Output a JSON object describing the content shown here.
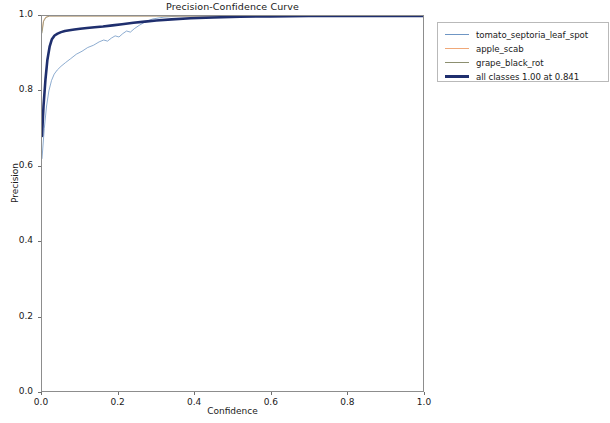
{
  "chart_data": {
    "type": "line",
    "title": "Precision-Confidence Curve",
    "xlabel": "Confidence",
    "ylabel": "Precision",
    "xlim": [
      0.0,
      1.0
    ],
    "ylim": [
      0.0,
      1.0
    ],
    "grid": false,
    "legend_position": "outside right top",
    "xticks": [
      "0.0",
      "0.2",
      "0.4",
      "0.6",
      "0.8",
      "1.0"
    ],
    "yticks": [
      "0.0",
      "0.2",
      "0.4",
      "0.6",
      "0.8",
      "1.0"
    ],
    "xtick_values": [
      0.0,
      0.2,
      0.4,
      0.6,
      0.8,
      1.0
    ],
    "ytick_values": [
      0.0,
      0.2,
      0.4,
      0.6,
      0.8,
      1.0
    ],
    "series": [
      {
        "name": "tomato_septoria_leaf_spot",
        "color": "#6f96c4",
        "width": 0.8,
        "x": [
          0.0,
          0.006,
          0.012,
          0.018,
          0.025,
          0.032,
          0.04,
          0.05,
          0.062,
          0.075,
          0.09,
          0.105,
          0.12,
          0.135,
          0.15,
          0.162,
          0.172,
          0.182,
          0.192,
          0.202,
          0.212,
          0.222,
          0.232,
          0.242,
          0.255,
          0.27,
          0.29,
          0.32,
          0.36,
          0.42,
          0.5,
          0.6,
          0.7,
          0.8,
          0.9,
          1.0
        ],
        "y": [
          0.62,
          0.7,
          0.76,
          0.8,
          0.828,
          0.845,
          0.856,
          0.866,
          0.876,
          0.886,
          0.898,
          0.906,
          0.916,
          0.922,
          0.931,
          0.936,
          0.933,
          0.941,
          0.947,
          0.944,
          0.953,
          0.96,
          0.957,
          0.966,
          0.975,
          0.984,
          0.992,
          0.997,
          1.0,
          1.0,
          1.0,
          1.0,
          1.0,
          1.0,
          1.0,
          1.0
        ]
      },
      {
        "name": "apple_scab",
        "color": "#f0a878",
        "width": 0.8,
        "x": [
          0.0,
          0.004,
          0.01,
          0.02,
          0.1,
          0.3,
          0.6,
          1.0
        ],
        "y": [
          0.96,
          0.988,
          0.997,
          1.0,
          1.0,
          1.0,
          1.0,
          1.0
        ]
      },
      {
        "name": "grape_black_rot",
        "color": "#8c8f70",
        "width": 0.8,
        "x": [
          0.0,
          0.004,
          0.01,
          0.02,
          0.1,
          0.3,
          0.6,
          1.0
        ],
        "y": [
          0.955,
          0.985,
          0.996,
          1.0,
          1.0,
          1.0,
          1.0,
          1.0
        ]
      },
      {
        "name": "all classes 1.00 at 0.841",
        "color": "#1f2f6e",
        "width": 2.6,
        "x": [
          0.0,
          0.004,
          0.009,
          0.014,
          0.02,
          0.026,
          0.033,
          0.041,
          0.05,
          0.06,
          0.072,
          0.085,
          0.1,
          0.118,
          0.138,
          0.16,
          0.185,
          0.21,
          0.24,
          0.27,
          0.3,
          0.34,
          0.39,
          0.45,
          0.52,
          0.6,
          0.7,
          0.841,
          0.92,
          1.0
        ],
        "y": [
          0.68,
          0.76,
          0.83,
          0.882,
          0.918,
          0.938,
          0.948,
          0.953,
          0.957,
          0.96,
          0.962,
          0.964,
          0.966,
          0.968,
          0.97,
          0.972,
          0.975,
          0.978,
          0.982,
          0.985,
          0.988,
          0.991,
          0.994,
          0.996,
          0.998,
          0.999,
          1.0,
          1.0,
          1.0,
          1.0
        ]
      }
    ],
    "legend": [
      {
        "label": "tomato_septoria_leaf_spot",
        "color": "#6f96c4",
        "thickness": "1.5px"
      },
      {
        "label": "apple_scab",
        "color": "#f0a878",
        "thickness": "1.5px"
      },
      {
        "label": "grape_black_rot",
        "color": "#8c8f70",
        "thickness": "1.5px"
      },
      {
        "label": "all classes 1.00 at 0.841",
        "color": "#1f2f6e",
        "thickness": "3px"
      }
    ]
  }
}
